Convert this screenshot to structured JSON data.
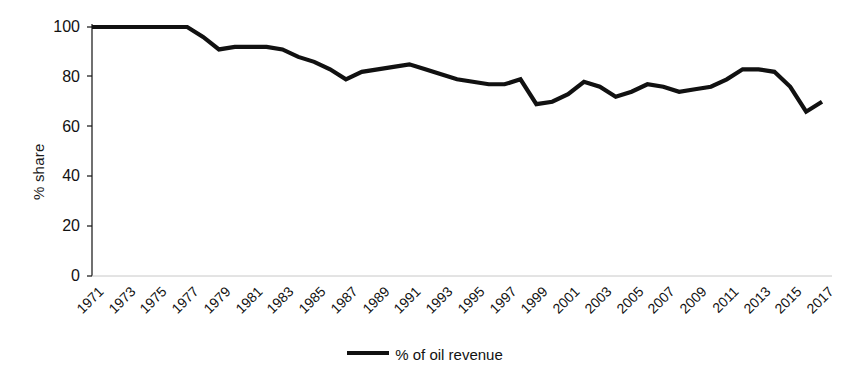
{
  "chart_data": {
    "type": "line",
    "title": "",
    "xlabel": "",
    "ylabel": "% share",
    "ylim": [
      0,
      100
    ],
    "yticks": [
      0,
      20,
      40,
      60,
      80,
      100
    ],
    "grid": false,
    "legend_position": "bottom",
    "legend": [
      "% of oil revenue"
    ],
    "xtick_labels": [
      "1971",
      "1973",
      "1975",
      "1977",
      "1979",
      "1981",
      "1983",
      "1985",
      "1987",
      "1989",
      "1991",
      "1993",
      "1995",
      "1997",
      "1999",
      "2001",
      "2003",
      "2005",
      "2007",
      "2009",
      "2011",
      "2013",
      "2015",
      "2017"
    ],
    "xtick_step": 2,
    "x": [
      1971,
      1972,
      1973,
      1974,
      1975,
      1976,
      1977,
      1978,
      1979,
      1980,
      1981,
      1982,
      1983,
      1984,
      1985,
      1986,
      1987,
      1988,
      1989,
      1990,
      1991,
      1992,
      1993,
      1994,
      1995,
      1996,
      1997,
      1998,
      1999,
      2000,
      2001,
      2002,
      2003,
      2004,
      2005,
      2006,
      2007,
      2008,
      2009,
      2010,
      2011,
      2012,
      2013,
      2014,
      2015,
      2016,
      2017
    ],
    "series": [
      {
        "name": "% of oil revenue",
        "color": "#111111",
        "values": [
          100,
          100,
          100,
          100,
          100,
          100,
          100,
          96,
          91,
          92,
          92,
          92,
          91,
          88,
          86,
          83,
          79,
          82,
          83,
          84,
          85,
          83,
          81,
          79,
          78,
          77,
          77,
          79,
          69,
          70,
          73,
          78,
          76,
          72,
          74,
          77,
          76,
          74,
          75,
          76,
          79,
          83,
          83,
          82,
          76,
          66,
          70
        ]
      }
    ]
  },
  "axes": {
    "ylabel": "% share",
    "ytick_values": [
      "100",
      "80",
      "60",
      "40",
      "20",
      "0"
    ]
  },
  "legend": {
    "series_label": "% of oil revenue"
  }
}
